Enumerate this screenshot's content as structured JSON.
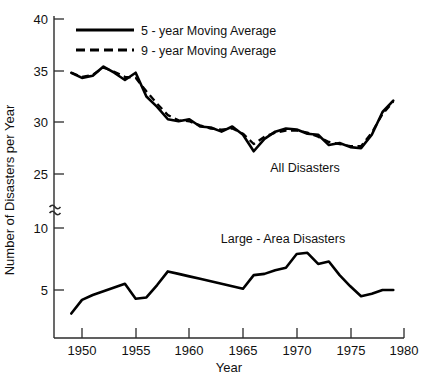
{
  "chart_data": {
    "type": "line",
    "title": "",
    "xlabel": "Year",
    "ylabel": "Number of Disasters per Year",
    "xlim": [
      1947.5,
      1980
    ],
    "xticks": [
      1950,
      1955,
      1960,
      1965,
      1970,
      1975,
      1980
    ],
    "xticklabels": [
      "1950",
      "1955",
      "1960",
      "1965",
      "1970",
      "1975",
      "1980"
    ],
    "yticks": [
      5,
      10,
      25,
      30,
      35,
      40
    ],
    "yticklabels": [
      "5",
      "10",
      "25",
      "30",
      "35",
      "40"
    ],
    "y_axis_break": true,
    "y_axis_break_symbol": "≈",
    "y_axis_break_note": "axis broken between 10 and 25",
    "grid": false,
    "legend_position": "top-left-inside",
    "legend": [
      {
        "label": "5 - year Moving Average",
        "style": "solid"
      },
      {
        "label": "9 - year Moving Average",
        "style": "dashed"
      }
    ],
    "annotations": [
      {
        "text": "All Disasters",
        "x": 1972.0,
        "y": 26.4
      },
      {
        "text": "Large - Area Disasters",
        "x": 1969.5,
        "y": 10.6
      }
    ],
    "groups": [
      {
        "name": "All Disasters",
        "series": [
          {
            "name": "5 - year Moving Average",
            "style": "solid",
            "x": [
              1949,
              1950,
              1951,
              1952,
              1953,
              1954,
              1955,
              1956,
              1957,
              1958,
              1959,
              1960,
              1961,
              1962,
              1963,
              1964,
              1965,
              1966,
              1967,
              1968,
              1969,
              1970,
              1971,
              1972,
              1973,
              1974,
              1975,
              1976,
              1977,
              1978,
              1979
            ],
            "y": [
              34.8,
              34.3,
              34.5,
              35.4,
              34.8,
              34.1,
              34.8,
              32.5,
              31.5,
              30.3,
              30.1,
              30.3,
              29.6,
              29.5,
              29.1,
              29.6,
              28.8,
              27.2,
              28.4,
              29.1,
              29.4,
              29.3,
              28.9,
              28.8,
              27.8,
              28.0,
              27.6,
              27.5,
              28.8,
              31.0,
              32.1
            ]
          },
          {
            "name": "9 - year Moving Average",
            "style": "dashed",
            "x": [
              1949,
              1950,
              1951,
              1952,
              1953,
              1954,
              1955,
              1956,
              1957,
              1958,
              1959,
              1960,
              1961,
              1962,
              1963,
              1964,
              1965,
              1966,
              1967,
              1968,
              1969,
              1970,
              1971,
              1972,
              1973,
              1974,
              1975,
              1976,
              1977,
              1978,
              1979
            ],
            "y": [
              34.8,
              34.4,
              34.6,
              35.3,
              34.9,
              34.4,
              34.3,
              33.0,
              31.8,
              30.7,
              30.2,
              30.1,
              29.7,
              29.4,
              29.3,
              29.4,
              28.9,
              27.9,
              28.6,
              29.0,
              29.2,
              29.2,
              29.0,
              28.6,
              28.1,
              27.9,
              27.7,
              27.7,
              29.0,
              30.8,
              32.0
            ]
          }
        ]
      },
      {
        "name": "Large - Area Disasters",
        "series": [
          {
            "name": "5 - year Moving Average",
            "style": "solid",
            "x": [
              1949,
              1950,
              1951,
              1952,
              1953,
              1954,
              1955,
              1956,
              1957,
              1958,
              1959,
              1960,
              1961,
              1962,
              1963,
              1964,
              1965,
              1966,
              1967,
              1968,
              1969,
              1970,
              1971,
              1972,
              1973,
              1974,
              1975,
              1976,
              1977,
              1978,
              1979
            ],
            "y": [
              3.1,
              4.2,
              4.6,
              4.9,
              5.2,
              5.5,
              4.3,
              4.4,
              5.4,
              6.5,
              6.3,
              6.1,
              5.9,
              5.7,
              5.5,
              5.3,
              5.1,
              6.2,
              6.3,
              6.6,
              6.8,
              7.9,
              8.0,
              7.1,
              7.3,
              6.2,
              5.3,
              4.5,
              4.7,
              5.0,
              5.0
            ]
          }
        ]
      }
    ]
  }
}
